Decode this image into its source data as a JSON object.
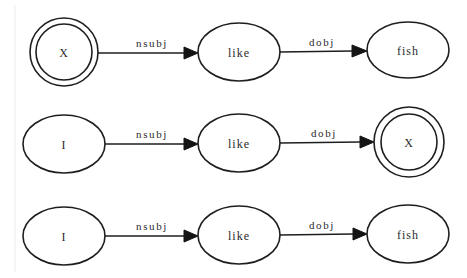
{
  "diagram": {
    "type": "dependency-pattern-graphs",
    "rows": [
      {
        "id": "pattern-1",
        "nodes": [
          {
            "label": "X",
            "shape": "doublecircle",
            "cx": 64,
            "cy": 52,
            "r": 34,
            "r_inner": 28
          },
          {
            "label": "like",
            "shape": "ellipse",
            "cx": 239,
            "cy": 52,
            "rx": 41,
            "ry": 29
          },
          {
            "label": "fish",
            "shape": "ellipse",
            "cx": 408,
            "cy": 50,
            "rx": 41,
            "ry": 28
          }
        ],
        "edges": [
          {
            "label": "nsubj",
            "from": "X",
            "to": "like"
          },
          {
            "label": "dobj",
            "from": "like",
            "to": "fish"
          }
        ]
      },
      {
        "id": "pattern-2",
        "nodes": [
          {
            "label": "I",
            "shape": "ellipse",
            "cx": 64,
            "cy": 144,
            "rx": 41,
            "ry": 29
          },
          {
            "label": "like",
            "shape": "ellipse",
            "cx": 239,
            "cy": 143,
            "rx": 41,
            "ry": 29
          },
          {
            "label": "X",
            "shape": "doublecircle",
            "cx": 409,
            "cy": 142,
            "r": 35,
            "r_inner": 28
          }
        ],
        "edges": [
          {
            "label": "nsubj",
            "from": "I",
            "to": "like"
          },
          {
            "label": "dobj",
            "from": "like",
            "to": "X"
          }
        ]
      },
      {
        "id": "pattern-3",
        "nodes": [
          {
            "label": "I",
            "shape": "ellipse",
            "cx": 64,
            "cy": 236,
            "rx": 41,
            "ry": 29
          },
          {
            "label": "like",
            "shape": "ellipse",
            "cx": 239,
            "cy": 235,
            "rx": 41,
            "ry": 29
          },
          {
            "label": "fish",
            "shape": "ellipse",
            "cx": 408,
            "cy": 234,
            "rx": 41,
            "ry": 29
          }
        ],
        "edges": [
          {
            "label": "nsubj",
            "from": "I",
            "to": "like"
          },
          {
            "label": "dobj",
            "from": "like",
            "to": "fish"
          }
        ]
      }
    ]
  },
  "colors": {
    "stroke": "#1e1e1e",
    "text": "#2a2a2a",
    "background": "#ffffff"
  }
}
